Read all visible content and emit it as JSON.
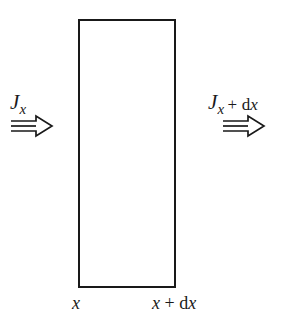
{
  "figure": {
    "type": "flux-control-volume-diagram",
    "background_color": "#ffffff",
    "stroke_color": "#191919",
    "control_volume": {
      "name": "control-volume-rectangle",
      "x": 78,
      "y": 19,
      "width": 98,
      "height": 269,
      "border_width_px": 2,
      "fill": "#ffffff"
    },
    "flux_in": {
      "symbol": "J",
      "subscript": "x",
      "arrow_glyph": "⇒",
      "arrow_direction": "right",
      "full_text": "J_x"
    },
    "flux_out": {
      "symbol": "J",
      "subscript": "x",
      "increment_operator": "+",
      "increment_d": "d",
      "increment_var": "x",
      "arrow_glyph": "⇒",
      "arrow_direction": "right",
      "full_text": "J_x + dx"
    },
    "position_left": {
      "var": "x",
      "full_text": "x"
    },
    "position_right": {
      "var": "x",
      "op": "+",
      "diff_d": "d",
      "diff_var": "x",
      "full_text": "x + dx"
    }
  }
}
